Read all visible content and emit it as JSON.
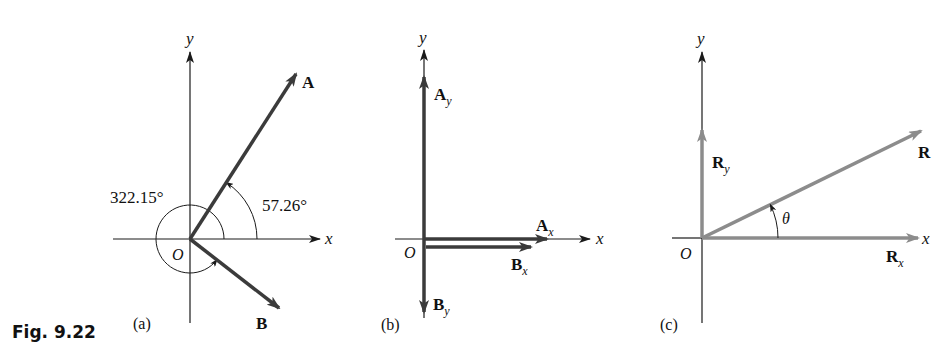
{
  "figure": {
    "label": "Fig. 9.22"
  },
  "colors": {
    "axis": "#1a1a1a",
    "dark_vector": "#3b3b3b",
    "light_vector": "#8c8c8c",
    "text": "#111111"
  },
  "panels": [
    {
      "id": "a",
      "caption": "(a)",
      "origin_label": "O",
      "x_label": "x",
      "y_label": "y",
      "vectors": [
        {
          "name": "A",
          "label": "A",
          "angle_deg": 57.26
        },
        {
          "name": "B",
          "label": "B",
          "angle_deg": 322.15
        }
      ],
      "angles": [
        {
          "label": "57.26°",
          "for": "A"
        },
        {
          "label": "322.15°",
          "for": "B"
        }
      ]
    },
    {
      "id": "b",
      "caption": "(b)",
      "origin_label": "O",
      "x_label": "x",
      "y_label": "y",
      "components": [
        {
          "label": "A",
          "sub": "y"
        },
        {
          "label": "A",
          "sub": "x"
        },
        {
          "label": "B",
          "sub": "x"
        },
        {
          "label": "B",
          "sub": "y"
        }
      ]
    },
    {
      "id": "c",
      "caption": "(c)",
      "origin_label": "O",
      "x_label": "x",
      "y_label": "y",
      "resultant": {
        "label": "R"
      },
      "components": [
        {
          "label": "R",
          "sub": "y"
        },
        {
          "label": "R",
          "sub": "x"
        }
      ],
      "angle": {
        "label": "θ"
      }
    }
  ]
}
